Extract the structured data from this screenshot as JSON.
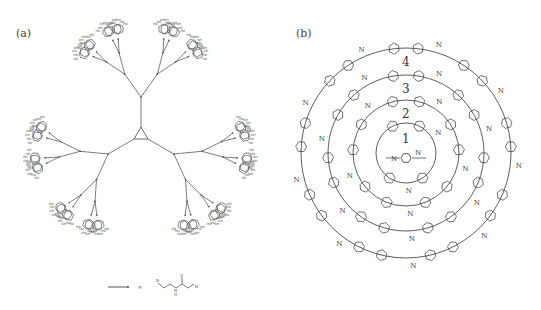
{
  "figure": {
    "panels": [
      {
        "id": "a",
        "label": "(a)",
        "description": "Glycodendrimer: radial dendritic scaffold with 3-fold core, branching amide linkers terminating in sugar (pyranose) rings with OH groups",
        "core": {
          "cx": 141,
          "cy": 135
        },
        "generations": 4,
        "terminal_group": "sugar ring (HO / OH labels)",
        "legend": {
          "linker_symbol": "branch line",
          "equals": "≡",
          "structure_label": "amide linker (N-H, C=O)",
          "atom_labels": [
            "O",
            "N",
            "H",
            "N"
          ]
        }
      },
      {
        "id": "b",
        "label": "(b)",
        "description": "Concentric macrocyclic rings of phenylene-imine units around a central benzene diimine",
        "center": {
          "cx": 406,
          "cy": 153
        },
        "rings": [
          {
            "number": "1",
            "radius": 30
          },
          {
            "number": "2",
            "radius": 53
          },
          {
            "number": "3",
            "radius": 78
          },
          {
            "number": "4",
            "radius": 105
          }
        ],
        "atom_label": "N",
        "center_unit_labels": [
          "N",
          "N"
        ]
      }
    ],
    "caption": ""
  }
}
